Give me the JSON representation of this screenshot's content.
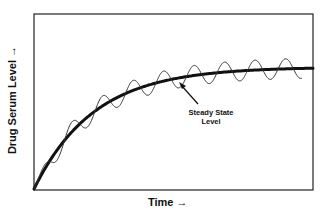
{
  "chart_data": {
    "type": "line",
    "title": "",
    "xlabel": "Time →",
    "ylabel": "Drug Serum Level →",
    "grid": false,
    "legend": null,
    "axis_ticks": "none",
    "series": [
      {
        "name": "Average drug serum level (thick curve)",
        "style": "thick",
        "description": "Rises from zero with diminishing slope, approaching a plateau (steady state) at about 70% of plot height around 70% of the time axis"
      },
      {
        "name": "Actual drug serum level with repeated dosing (thin curve)",
        "style": "thin oscillating",
        "description": "Oscillates above and below the average curve with peaks and troughs after each dose; ~9 cycles total; ends before right edge"
      }
    ],
    "annotations": [
      {
        "text": "Steady State Level",
        "arrow_to": "plateau of thick curve"
      }
    ],
    "colors": {
      "line": "#111111",
      "background": "#ffffff"
    }
  },
  "labels": {
    "y_axis": "Drug Serum Level →",
    "x_axis": "Time →",
    "annotation_line1": "Steady State",
    "annotation_line2": "Level"
  }
}
